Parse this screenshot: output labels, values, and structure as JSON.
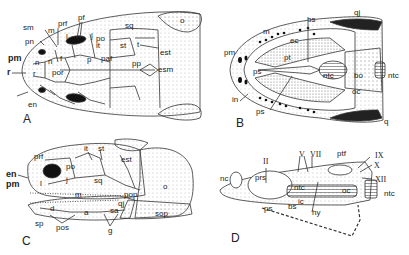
{
  "figure": {
    "panels": [
      {
        "id": "A",
        "view": "dorsal skull"
      },
      {
        "id": "B",
        "view": "ventral palate"
      },
      {
        "id": "C",
        "view": "lateral skull"
      },
      {
        "id": "D",
        "view": "braincase lateral"
      }
    ]
  },
  "panelA": {
    "letter": "A",
    "labels": {
      "sm": "sm",
      "m": "m",
      "prf": "prf",
      "pf": "pf",
      "l": "l",
      "j": "j",
      "po": "po",
      "it": "it",
      "sq": "sq",
      "o": "o",
      "st": "st",
      "t": "t",
      "est": "est",
      "pp": "pp",
      "esm": "esm",
      "p": "p",
      "paf": "paf",
      "pn": "pn",
      "pm": "pm",
      "n1": "n",
      "n2": "n",
      "f": "f",
      "por": "por",
      "r1": "r",
      "r2": "r",
      "en": "en"
    }
  },
  "panelB": {
    "letter": "B",
    "labels": {
      "qj": "qj",
      "bs": "bs",
      "m": "m",
      "ec": "ec",
      "pt": "pt",
      "pm": "pm",
      "ps1": "ps",
      "ps2": "ps",
      "in": "in",
      "ntc1": "ntc",
      "ntc2": "ntc",
      "bo": "bo",
      "oc": "oc",
      "q": "q",
      "rf": "rf"
    }
  },
  "panelC": {
    "letter": "C",
    "labels": {
      "it": "it",
      "st": "st",
      "est": "est",
      "prf": "prf",
      "po": "po",
      "en": "en",
      "pm": "pm",
      "l": "l",
      "j": "j",
      "sq": "sq",
      "o": "o",
      "m": "m",
      "pop": "pop",
      "qj": "qj",
      "d": "d",
      "a": "a",
      "sa": "sa",
      "sop": "sop",
      "sp": "sp",
      "pos": "pos",
      "g": "g"
    }
  },
  "panelD": {
    "letter": "D",
    "labels": {
      "II": "II",
      "V": "V",
      "VII": "VII",
      "ptf": "ptf",
      "IX": "IX",
      "X": "X",
      "XII": "XII",
      "nc": "nc",
      "prs": "prs",
      "ntc1": "ntc",
      "ntc2": "ntc",
      "oc": "oc",
      "ps": "ps",
      "bs": "bs",
      "ic": "ic",
      "hy": "hy"
    }
  }
}
